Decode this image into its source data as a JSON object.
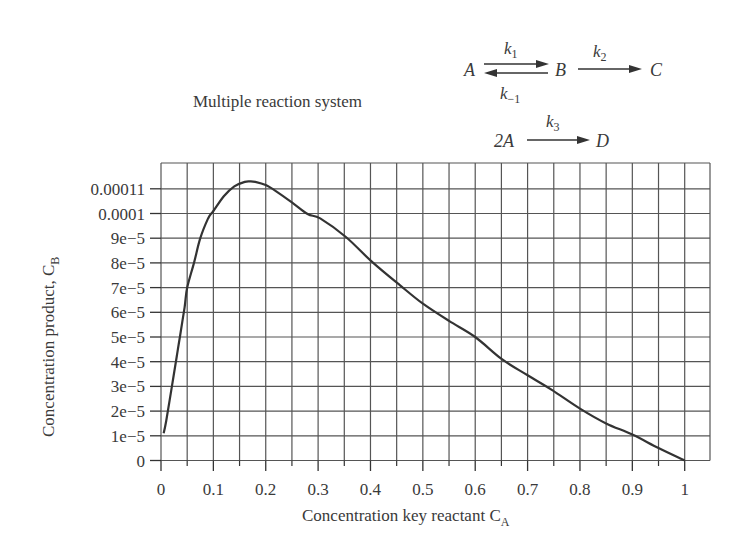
{
  "chart_data": {
    "type": "line",
    "title": "Multiple reaction system",
    "xlabel": "Concentration key reactant C_A",
    "ylabel": "Concentration product, C_B",
    "xlim": [
      0,
      1.05
    ],
    "ylim": [
      0,
      0.000122
    ],
    "grid": true,
    "legend": null,
    "x_ticks": [
      0,
      0.1,
      0.2,
      0.3,
      0.4,
      0.5,
      0.6,
      0.7,
      0.8,
      0.9,
      1
    ],
    "x_tick_labels": [
      "0",
      "0.1",
      "0.2",
      "0.3",
      "0.4",
      "0.5",
      "0.6",
      "0.7",
      "0.8",
      "0.9",
      "1"
    ],
    "x_minor_ticks": [
      0.05,
      0.15,
      0.25,
      0.35,
      0.45,
      0.55,
      0.65,
      0.75,
      0.85,
      0.95
    ],
    "y_ticks": [
      0,
      1e-05,
      2e-05,
      3e-05,
      4e-05,
      5e-05,
      6e-05,
      7e-05,
      8e-05,
      9e-05,
      0.0001,
      0.00011
    ],
    "y_tick_labels": [
      "0",
      "1e−5",
      "2e−5",
      "3e−5",
      "4e−5",
      "5e−5",
      "6e−5",
      "7e−5",
      "8e−5",
      "9e−5",
      "0.0001",
      "0.00011"
    ],
    "series": [
      {
        "name": "C_B vs C_A",
        "color": "#333333",
        "x": [
          0.005,
          0.01,
          0.02,
          0.03,
          0.036,
          0.045,
          0.05,
          0.063,
          0.075,
          0.09,
          0.1,
          0.12,
          0.14,
          0.16,
          0.17,
          0.18,
          0.2,
          0.22,
          0.25,
          0.28,
          0.304,
          0.353,
          0.403,
          0.456,
          0.5,
          0.55,
          0.6,
          0.651,
          0.7,
          0.747,
          0.8,
          0.85,
          0.9,
          0.95,
          1.0
        ],
        "y": [
          1.1e-05,
          1.6e-05,
          2.9e-05,
          4.2e-05,
          5e-05,
          6.2e-05,
          7e-05,
          8e-05,
          9e-05,
          9.8e-05,
          0.000101,
          0.000107,
          0.000111,
          0.0001128,
          0.000113,
          0.0001128,
          0.0001115,
          0.000109,
          0.0001045,
          9.98e-05,
          9.8e-05,
          9.05e-05,
          8.04e-05,
          7.1e-05,
          6.35e-05,
          5.65e-05,
          5e-05,
          4.1e-05,
          3.45e-05,
          2.85e-05,
          2.1e-05,
          1.5e-05,
          1.05e-05,
          5e-06,
          0.0
        ]
      }
    ],
    "annotations": {
      "reaction_1": {
        "reactant": "A",
        "intermediate": "B",
        "product": "C",
        "k_forward": "k",
        "k_forward_sub": "1",
        "k_reverse": "k",
        "k_reverse_sub": "−1",
        "k_next": "k",
        "k_next_sub": "2"
      },
      "reaction_2": {
        "reactant": "2A",
        "product": "D",
        "k": "k",
        "k_sub": "3"
      }
    }
  },
  "labels": {
    "title": "Multiple reaction system",
    "xlabel_main": "Concentration key reactant C",
    "xlabel_sub": "A",
    "ylabel_main": "Concentration product, C",
    "ylabel_sub": "B"
  }
}
